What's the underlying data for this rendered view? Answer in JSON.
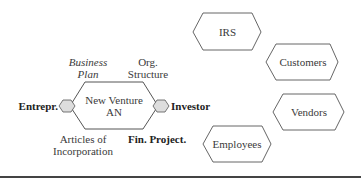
{
  "diagram": {
    "center_node": {
      "line1": "New Venture",
      "line2": "AN"
    },
    "center_labels": {
      "top_left": {
        "line1": "Business",
        "line2": "Plan",
        "style": "italic"
      },
      "top_right": {
        "line1": "Org.",
        "line2": "Structure"
      },
      "left": {
        "text": "Entrepr.",
        "style": "bold"
      },
      "right": {
        "text": "Investor",
        "style": "bold"
      },
      "bottom_left": {
        "line1": "Articles of",
        "line2": "Incorporation"
      },
      "bottom_right": {
        "text": "Fin. Project.",
        "style": "bold"
      }
    },
    "external_nodes": [
      {
        "label": "IRS"
      },
      {
        "label": "Customers"
      },
      {
        "label": "Vendors"
      },
      {
        "label": "Employees"
      }
    ],
    "colors": {
      "stroke": "#555555",
      "port_fill": "#dddddd",
      "baseline": "#444444"
    }
  }
}
